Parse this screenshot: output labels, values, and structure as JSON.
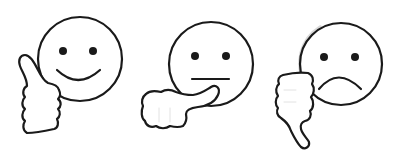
{
  "image": {
    "description": "Three hand-drawn smiley faces with hand gestures: thumbs up, sideways thumb, thumbs down",
    "background": "#ffffff",
    "stroke_color": "#1a1a1a",
    "fill_color": "#ffffff",
    "shadow_color": "#d8d8d8"
  },
  "icons": [
    {
      "id": "positive",
      "label": "Happy face with thumbs up",
      "expression": "smile",
      "gesture": "thumbs-up"
    },
    {
      "id": "neutral",
      "label": "Neutral face with sideways thumb",
      "expression": "straight-mouth",
      "gesture": "thumb-sideways"
    },
    {
      "id": "negative",
      "label": "Sad face with thumbs down",
      "expression": "frown",
      "gesture": "thumbs-down"
    }
  ]
}
